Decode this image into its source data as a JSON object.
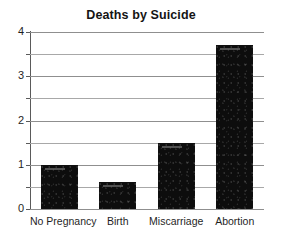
{
  "chart_data": {
    "type": "bar",
    "title": "Deaths by Suicide",
    "xlabel": "",
    "ylabel": "",
    "categories": [
      "No Pregnancy",
      "Birth",
      "Miscarriage",
      "Abortion"
    ],
    "values": [
      1.0,
      0.6,
      1.5,
      3.7
    ],
    "ylim": [
      0,
      4
    ],
    "ytick_labels": [
      "0",
      "1",
      "2",
      "3",
      "4"
    ],
    "ytick_values": [
      0,
      1,
      2,
      3,
      4
    ],
    "gridlines_at": [
      0,
      0.5,
      1,
      1.5,
      2,
      2.5,
      3,
      3.5,
      4
    ],
    "grid": true,
    "legend": "none",
    "bar_color": "#0d0d0d",
    "grid_color": "#8f8f8f",
    "axis_color": "#5a5a5a",
    "background_color": "#ffffff"
  }
}
